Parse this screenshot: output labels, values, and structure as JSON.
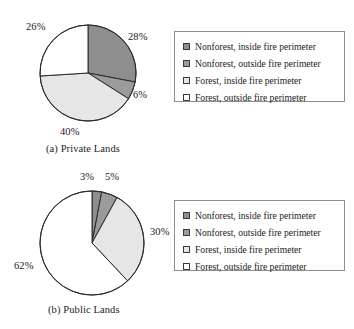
{
  "figure": {
    "panels": [
      {
        "id": "private-lands",
        "caption": "(a) Private Lands",
        "labels": [
          "28%",
          "6%",
          "40%",
          "26%"
        ]
      },
      {
        "id": "public-lands",
        "caption": "(b) Public Lands",
        "labels": [
          "3%",
          "5%",
          "30%",
          "62%"
        ]
      }
    ],
    "legend": {
      "items": [
        {
          "label": "Nonforest, inside fire perimeter",
          "swatch": "swatch-dark-gray",
          "color": "#8e8e8e"
        },
        {
          "label": "Nonforest, outside fire perimeter",
          "swatch": "swatch-mid-gray",
          "color": "#9b9b9b"
        },
        {
          "label": "Forest, inside fire perimeter",
          "swatch": "swatch-light-gray",
          "color": "#e6e6e6"
        },
        {
          "label": "Forest, outside fire perimeter",
          "swatch": "swatch-white",
          "color": "#ffffff"
        }
      ]
    }
  },
  "chart_data": [
    {
      "type": "pie",
      "title": "(a) Private Lands",
      "categories": [
        "Nonforest, inside fire perimeter",
        "Nonforest, outside fire perimeter",
        "Forest, inside fire perimeter",
        "Forest, outside fire perimeter"
      ],
      "values": [
        28,
        6,
        40,
        26
      ],
      "value_labels": [
        "28%",
        "6%",
        "40%",
        "26%"
      ],
      "units": "percent",
      "colors": [
        "#8e8e8e",
        "#9b9b9b",
        "#e6e6e6",
        "#ffffff"
      ],
      "start_angle_deg": 0,
      "direction": "clockwise",
      "legend_position": "right",
      "grid": false
    },
    {
      "type": "pie",
      "title": "(b) Public Lands",
      "categories": [
        "Nonforest, inside fire perimeter",
        "Nonforest, outside fire perimeter",
        "Forest, inside fire perimeter",
        "Forest, outside fire perimeter"
      ],
      "values": [
        3,
        5,
        30,
        62
      ],
      "value_labels": [
        "3%",
        "5%",
        "30%",
        "62%"
      ],
      "units": "percent",
      "colors": [
        "#8e8e8e",
        "#9b9b9b",
        "#e6e6e6",
        "#ffffff"
      ],
      "start_angle_deg": 0,
      "direction": "clockwise",
      "legend_position": "right",
      "grid": false
    }
  ]
}
